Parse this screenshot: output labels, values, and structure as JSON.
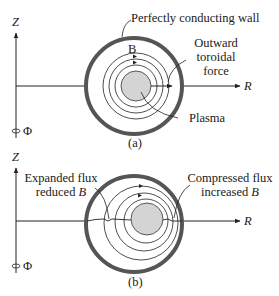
{
  "figure_a": {
    "caption": "(a)",
    "axis_z": "Z",
    "axis_r": "R",
    "axis_phi": "Φ",
    "wall_label": "Perfectly conducting wall",
    "field_label": "B",
    "force_label_line1": "Outward",
    "force_label_line2": "toroidal",
    "force_label_line3": "force",
    "plasma_label": "Plasma"
  },
  "figure_b": {
    "caption": "(b)",
    "axis_z": "Z",
    "axis_r": "R",
    "axis_phi": "Φ",
    "left_label_line1": "Expanded flux",
    "left_label_line2_text": "reduced ",
    "left_label_line2_var": "B",
    "right_label_line1": "Compressed flux",
    "right_label_line2_text": "increased ",
    "right_label_line2_var": "B"
  },
  "colors": {
    "wall": "#555555",
    "plasma_fill": "#d4d4d4",
    "line": "#222222"
  }
}
